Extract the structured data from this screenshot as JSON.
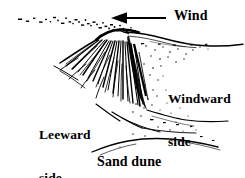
{
  "figure": {
    "style": "black and white pen-and-ink line drawing",
    "background_color": "#ffffff",
    "ink_color": "#000000",
    "width": 245,
    "height": 178
  },
  "labels": {
    "wind": "Wind",
    "windward": "Windward\nside",
    "windward_line1": "Windward",
    "windward_line2": "side",
    "leeward": "Leeward\nside",
    "leeward_line1": "Leeward",
    "leeward_line2": "side",
    "sand_dune": "Sand dune"
  },
  "arrow": {
    "name": "wind-direction-arrow",
    "direction": "left",
    "description": "solid triangular arrowhead with thin straight shaft",
    "shaft_from_x": 166,
    "shaft_to_x": 121,
    "y": 18,
    "head_tip_x": 111
  },
  "dune": {
    "crest_x": 120,
    "crest_y": 30,
    "leeward_description": "steep slip face on the left with fanning curved hatch streaks",
    "windward_description": "gentle stippled slope descending to the right",
    "blowing_sand_description": "dashes and dots of sand blown left off the crest"
  }
}
